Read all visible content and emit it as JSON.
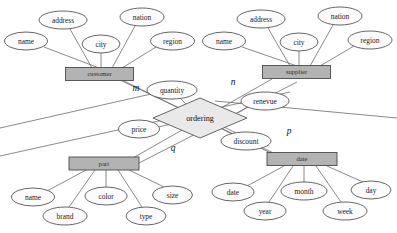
{
  "diagram": {
    "type": "entity-relationship",
    "background_color": "#ffffff",
    "entity_fill_color": "#b3b3b3",
    "attribute_fill_color": "#fbfbfb",
    "relationship_fill_color": "#e9e9e9",
    "line_color": "#6b6b6b"
  },
  "entities": [
    {
      "id": "customer",
      "label": "customer",
      "x": 99.5,
      "y": 74,
      "w": 68,
      "h": 13,
      "attributes": [
        {
          "label": "name",
          "cx": 26,
          "cy": 41,
          "rx": 21.5,
          "ry": 9
        },
        {
          "label": "address",
          "cx": 63,
          "cy": 20,
          "rx": 24,
          "ry": 9
        },
        {
          "label": "city",
          "cx": 101,
          "cy": 44,
          "rx": 19,
          "ry": 9
        },
        {
          "label": "nation",
          "cx": 142,
          "cy": 17,
          "rx": 22,
          "ry": 9
        },
        {
          "label": "region",
          "cx": 172.5,
          "cy": 41,
          "rx": 22,
          "ry": 9
        }
      ]
    },
    {
      "id": "supplier",
      "label": "supplier",
      "x": 296.5,
      "y": 72,
      "w": 68,
      "h": 13,
      "attributes": [
        {
          "label": "name",
          "cx": 224,
          "cy": 41,
          "rx": 21.5,
          "ry": 9
        },
        {
          "label": "address",
          "cx": 261,
          "cy": 19,
          "rx": 24,
          "ry": 9
        },
        {
          "label": "city",
          "cx": 299,
          "cy": 42,
          "rx": 19,
          "ry": 9
        },
        {
          "label": "nation",
          "cx": 340,
          "cy": 16,
          "rx": 22,
          "ry": 9
        },
        {
          "label": "region",
          "cx": 370,
          "cy": 40,
          "rx": 22,
          "ry": 9
        }
      ]
    },
    {
      "id": "part",
      "label": "part",
      "x": 104,
      "y": 163.5,
      "w": 70,
      "h": 13,
      "attributes": [
        {
          "label": "name",
          "cx": 33,
          "cy": 197,
          "rx": 21.5,
          "ry": 9
        },
        {
          "label": "brand",
          "cx": 65,
          "cy": 216,
          "rx": 22,
          "ry": 9
        },
        {
          "label": "color",
          "cx": 106,
          "cy": 196,
          "rx": 21,
          "ry": 9
        },
        {
          "label": "type",
          "cx": 146,
          "cy": 216,
          "rx": 20,
          "ry": 9
        },
        {
          "label": "size",
          "cx": 172.5,
          "cy": 195,
          "rx": 20,
          "ry": 9
        }
      ]
    },
    {
      "id": "date",
      "label": "date",
      "x": 302,
      "y": 159,
      "w": 70,
      "h": 13,
      "attributes": [
        {
          "label": "date",
          "cx": 233,
          "cy": 192,
          "rx": 21,
          "ry": 9
        },
        {
          "label": "year",
          "cx": 265,
          "cy": 211,
          "rx": 21,
          "ry": 9
        },
        {
          "label": "month",
          "cx": 304,
          "cy": 191,
          "rx": 23,
          "ry": 9
        },
        {
          "label": "week",
          "cx": 345,
          "cy": 211,
          "rx": 22,
          "ry": 9
        },
        {
          "label": "day",
          "cx": 371,
          "cy": 190,
          "rx": 20,
          "ry": 9
        }
      ]
    }
  ],
  "relationship": {
    "id": "ordering",
    "label": "ordering",
    "cx": 200,
    "cy": 118,
    "rx": 47,
    "ry": 20,
    "attributes": [
      {
        "label": "quantity",
        "cx": 172,
        "cy": 90,
        "rx": 25,
        "ry": 9
      },
      {
        "label": "renevue",
        "cx": 265,
        "cy": 101,
        "rx": 24,
        "ry": 9
      },
      {
        "label": "price",
        "cx": 139,
        "cy": 129,
        "rx": 20.5,
        "ry": 9
      },
      {
        "label": "discount",
        "cx": 246,
        "cy": 141,
        "rx": 25,
        "ry": 9
      }
    ]
  },
  "cardinalities": [
    {
      "label": "m",
      "x": 136,
      "y": 89
    },
    {
      "label": "n",
      "x": 233,
      "y": 83
    },
    {
      "label": "p",
      "x": 289,
      "y": 132
    },
    {
      "label": "q",
      "x": 173,
      "y": 149
    }
  ]
}
